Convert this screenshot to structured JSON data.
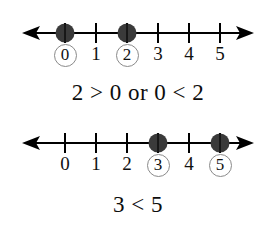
{
  "figure": {
    "background_color": "#ffffff",
    "ink_color": "#000000",
    "dot_color": "#3a3a3a",
    "circle_color": "#8a8a8a"
  },
  "number_lines": [
    {
      "name": "number-line-top",
      "range": [
        0,
        5
      ],
      "tick_labels": [
        "0",
        "1",
        "2",
        "3",
        "4",
        "5"
      ],
      "marked_points": [
        0,
        2
      ],
      "circled_labels": [
        0,
        2
      ],
      "left_arrow": "←",
      "right_arrow": "→"
    },
    {
      "name": "number-line-bottom",
      "range": [
        0,
        5
      ],
      "tick_labels": [
        "0",
        "1",
        "2",
        "3",
        "4",
        "5"
      ],
      "marked_points": [
        3,
        5
      ],
      "circled_labels": [
        3,
        5
      ],
      "left_arrow": "←",
      "right_arrow": "→"
    }
  ],
  "statements": [
    {
      "name": "statement-top",
      "text": "2 > 0 or 0 < 2"
    },
    {
      "name": "statement-bottom",
      "text": "3 < 5"
    }
  ]
}
